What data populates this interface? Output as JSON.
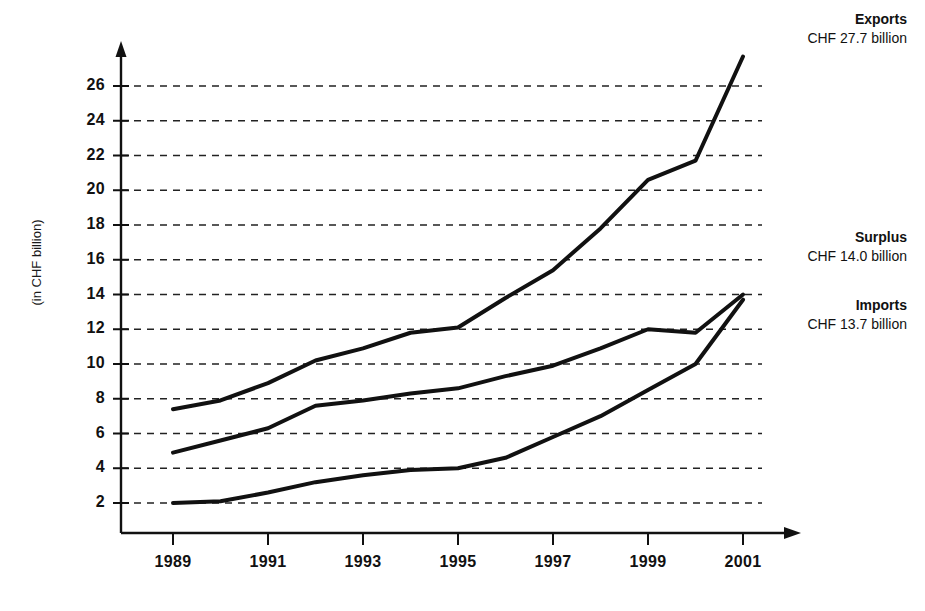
{
  "chart_data": {
    "type": "line",
    "title": "",
    "xlabel": "",
    "ylabel": "(in CHF billion)",
    "xlim": [
      1988.5,
      2001.6
    ],
    "ylim": [
      0.6,
      28.2
    ],
    "yticks": [
      2,
      4,
      6,
      8,
      10,
      12,
      14,
      16,
      18,
      20,
      22,
      24,
      26
    ],
    "xticks": [
      1989,
      1991,
      1993,
      1995,
      1997,
      1999,
      2001
    ],
    "xtick_labels": [
      "1989",
      "1991",
      "1993",
      "1995",
      "1997",
      "1999",
      "2001"
    ],
    "grid": "horizontal-dashed",
    "legend_position": "right-inline-annotations",
    "x": [
      1989,
      1990,
      1991,
      1992,
      1993,
      1994,
      1995,
      1996,
      1997,
      1998,
      1999,
      2000,
      2001
    ],
    "series": [
      {
        "name": "Exports",
        "end_label": "CHF 27.7 billion",
        "values": [
          7.4,
          7.9,
          8.9,
          10.2,
          10.9,
          11.8,
          12.1,
          13.8,
          15.4,
          17.8,
          20.6,
          21.7,
          27.7
        ],
        "color": "#111111"
      },
      {
        "name": "Surplus",
        "end_label": "CHF 14.0 billion",
        "values": [
          4.9,
          5.6,
          6.3,
          7.6,
          7.9,
          8.3,
          8.6,
          9.3,
          9.9,
          10.9,
          12.0,
          11.8,
          14.0
        ],
        "color": "#111111"
      },
      {
        "name": "Imports",
        "end_label": "CHF 13.7 billion",
        "values": [
          2.0,
          2.1,
          2.6,
          3.2,
          3.6,
          3.9,
          4.0,
          4.6,
          5.8,
          7.0,
          8.5,
          10.0,
          13.7
        ],
        "color": "#111111"
      }
    ],
    "annotations": [
      {
        "name": "Exports",
        "value": "CHF 27.7 billion"
      },
      {
        "name": "Surplus",
        "value": "CHF 14.0 billion"
      },
      {
        "name": "Imports",
        "value": "CHF 13.7 billion"
      }
    ]
  },
  "axis": {
    "y_title": "(in CHF billion)"
  }
}
